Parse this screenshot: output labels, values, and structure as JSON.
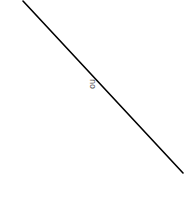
{
  "diagram": {
    "line": {
      "x1": 23,
      "y1": 1,
      "x2": 183,
      "y2": 173,
      "color": "#000000",
      "width": 1.6
    },
    "label": {
      "text": "no",
      "rotation_deg": 90
    }
  }
}
